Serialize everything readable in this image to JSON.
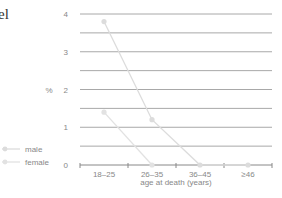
{
  "cropped_text": "el",
  "chart_data": {
    "type": "line",
    "title": "",
    "xlabel": "age at death (years)",
    "ylabel": "%",
    "categories": [
      "18–25",
      "26–35",
      "36–45",
      "≥46"
    ],
    "series": [
      {
        "name": "male",
        "values": [
          3.8,
          1.2,
          0,
          0
        ],
        "color": "#dcdcdc"
      },
      {
        "name": "female",
        "values": [
          1.4,
          0,
          null,
          null
        ],
        "color": "#e2e2e2"
      }
    ],
    "ylim": [
      0,
      4
    ],
    "yticks": [
      0,
      1,
      2,
      3,
      4
    ],
    "grid": true,
    "grid_step": 0.5,
    "legend_position": "left"
  },
  "legend": {
    "items": [
      {
        "label": "male"
      },
      {
        "label": "female"
      }
    ]
  },
  "axis": {
    "y_unit": "%",
    "x_title": "age at death (years)"
  }
}
